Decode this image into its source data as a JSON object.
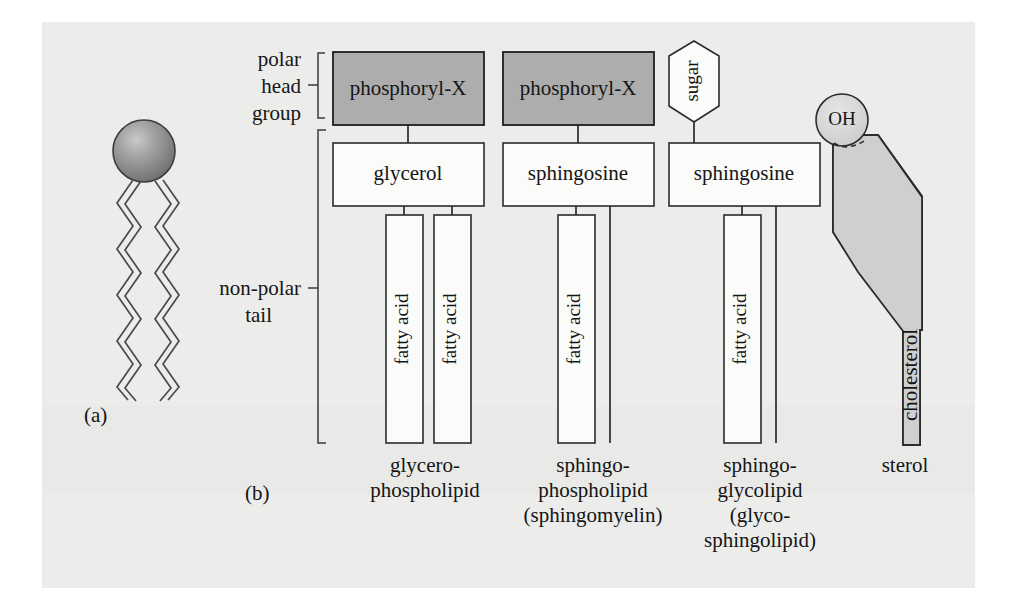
{
  "figure": {
    "panel_labels": {
      "a": "(a)",
      "b": "(b)"
    },
    "side_labels": {
      "polar_head_group": [
        "polar",
        "head",
        "group"
      ],
      "non_polar_tail": [
        "non-polar",
        "tail"
      ]
    }
  },
  "colors": {
    "background": "#ffffff",
    "scan_panel": "#ececeb",
    "head_group_fill": "#adadad",
    "box_fill": "#fbfbfa",
    "cholesterol_fill": "#cfcfcf",
    "oh_fill": "#d8d8d8",
    "sphere_light": "#d5d5d5",
    "sphere_dark": "#6e6e6e",
    "stroke": "#2b2b2b"
  },
  "panel_a": {
    "label": "(a)",
    "head_shape": "sphere",
    "tail_count": 2,
    "tail_description": "zigzag hydrocarbon chains"
  },
  "panel_b": {
    "label": "(b)",
    "columns": [
      {
        "id": "glycerophospholipid",
        "head": {
          "label": "phosphoryl-X",
          "shape": "rect",
          "fill": "gray"
        },
        "backbone": {
          "label": "glycerol",
          "shape": "rect",
          "fill": "white"
        },
        "tails": [
          {
            "label": "fatty acid"
          },
          {
            "label": "fatty acid"
          }
        ],
        "caption": [
          "glycero-",
          "phospholipid"
        ]
      },
      {
        "id": "sphingophospholipid",
        "head": {
          "label": "phosphoryl-X",
          "shape": "rect",
          "fill": "gray"
        },
        "backbone": {
          "label": "sphingosine",
          "shape": "rect",
          "fill": "white"
        },
        "tails": [
          {
            "label": "fatty acid"
          }
        ],
        "caption": [
          "sphingo-",
          "phospholipid",
          "(sphingomyelin)"
        ]
      },
      {
        "id": "sphingoglycolipid",
        "head": {
          "label": "sugar",
          "shape": "hexagon",
          "fill": "white"
        },
        "backbone": {
          "label": "sphingosine",
          "shape": "rect",
          "fill": "white"
        },
        "tails": [
          {
            "label": "fatty acid"
          }
        ],
        "caption": [
          "sphingo-",
          "glycolipid",
          "(glyco-",
          "sphingolipid)"
        ]
      },
      {
        "id": "sterol",
        "head": {
          "label": "OH",
          "shape": "circle",
          "fill": "lightgray"
        },
        "body": {
          "label": "cholesterol",
          "shape": "polygon",
          "fill": "gray"
        },
        "caption": [
          "sterol"
        ]
      }
    ]
  }
}
